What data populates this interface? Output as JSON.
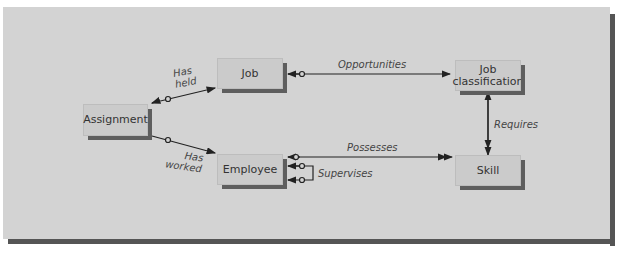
{
  "diagram": {
    "entities": [
      {
        "id": "assignment",
        "label": "Assignment"
      },
      {
        "id": "job",
        "label": "Job"
      },
      {
        "id": "employee",
        "label": "Employee"
      },
      {
        "id": "job_classification",
        "label": "Job\nclassification"
      },
      {
        "id": "skill",
        "label": "Skill"
      }
    ],
    "relationships": [
      {
        "label": "Has\nheld",
        "from": "Job",
        "to": "Assignment"
      },
      {
        "label": "Has\nworked",
        "from": "Employee",
        "to": "Assignment"
      },
      {
        "label": "Opportunities",
        "from": "Job",
        "to": "Job classification"
      },
      {
        "label": "Possesses",
        "from": "Employee",
        "to": "Skill"
      },
      {
        "label": "Supervises",
        "from": "Employee",
        "to": "Employee"
      },
      {
        "label": "Requires",
        "from": "Job classification",
        "to": "Skill"
      }
    ]
  },
  "colors": {
    "panel": "#d3d3d3",
    "entity": "#cbcbcb",
    "shadow": "#555555",
    "line": "#222222"
  }
}
